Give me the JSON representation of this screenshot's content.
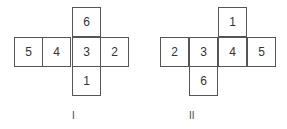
{
  "nets": [
    {
      "label": "I",
      "cells": [
        {
          "value": "6",
          "x": 72,
          "y": 7
        },
        {
          "value": "5",
          "x": 14,
          "y": 37
        },
        {
          "value": "4",
          "x": 43,
          "y": 37
        },
        {
          "value": "3",
          "x": 72,
          "y": 37
        },
        {
          "value": "2",
          "x": 101,
          "y": 37
        },
        {
          "value": "1",
          "x": 72,
          "y": 67
        }
      ],
      "label_pos": {
        "x": 72,
        "y": 110
      }
    },
    {
      "label": "II",
      "cells": [
        {
          "value": "1",
          "x": 218,
          "y": 7
        },
        {
          "value": "2",
          "x": 160,
          "y": 37
        },
        {
          "value": "3",
          "x": 189,
          "y": 37
        },
        {
          "value": "4",
          "x": 218,
          "y": 37
        },
        {
          "value": "5",
          "x": 247,
          "y": 37
        },
        {
          "value": "6",
          "x": 189,
          "y": 67
        }
      ],
      "label_pos": {
        "x": 189,
        "y": 110
      }
    }
  ]
}
